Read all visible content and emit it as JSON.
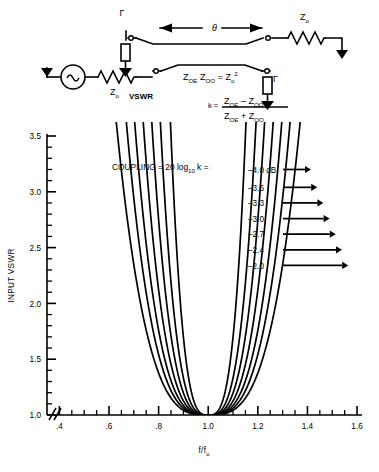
{
  "figure": {
    "title_text": "",
    "schematic": {
      "name": "directional-coupler-schematic",
      "labels": {
        "gamma_top_left": "Γ",
        "gamma_bottom_right": "Γ",
        "theta": "θ",
        "z0_top_right": "Z",
        "z0_top_right_sub": "o",
        "z0_source": "Z",
        "z0_source_sub": "o",
        "vswr": "VSWR",
        "impedance_relation_a": "Z",
        "impedance_relation_a_sub": "OE",
        "impedance_relation_b": "Z",
        "impedance_relation_b_sub": "OO",
        "impedance_relation_eq": "=",
        "impedance_relation_c": "Z",
        "impedance_relation_c_sub": "o",
        "impedance_relation_c_sup": "2",
        "k_eq": "k =",
        "k_num_a": "Z",
        "k_num_a_sub": "OE",
        "k_num_minus": "–",
        "k_num_b": "Z",
        "k_num_b_sub": "OO",
        "k_den_a": "Z",
        "k_den_a_sub": "OE",
        "k_den_plus": "+",
        "k_den_b": "Z",
        "k_den_b_sub": "OO"
      }
    },
    "annotations": {
      "coupling_formula": "COUPLING = 20 log",
      "coupling_formula_sub": "10",
      "coupling_formula_tail": "k ="
    }
  },
  "chart_data": {
    "type": "line",
    "title": "",
    "xlabel": "f/f",
    "xlabel_sub": "o",
    "ylabel": "INPUT VSWR",
    "xlim": [
      0.35,
      1.62
    ],
    "ylim": [
      1.0,
      3.5
    ],
    "xticks": [
      0.4,
      0.6,
      0.8,
      1.0,
      1.2,
      1.4,
      1.6
    ],
    "xtick_labels": [
      ".4",
      ".6",
      ".8",
      "1.0",
      "1.2",
      "1.4",
      "1.6"
    ],
    "x_minor_step": 0.05,
    "yticks": [
      1.0,
      1.5,
      2.0,
      2.5,
      3.0,
      3.5
    ],
    "ytick_labels": [
      "1.0",
      "1.5",
      "2.0",
      "2.5",
      "3.0",
      "3.5"
    ],
    "y_minor_step": 0.1,
    "grid": false,
    "axis_break": true,
    "axis_break_symbol": "//",
    "legend_position": "right-inside",
    "legend_title": "COUPLING = 20 log10 k =",
    "legend_units": "dB",
    "series": [
      {
        "name": "-4.0 dB",
        "label": "–4.0 dB",
        "k": 0.631,
        "vswr_max": 3.52,
        "arrow_y": 3.2
      },
      {
        "name": "-3.6",
        "label": "–3.6",
        "k": 0.661,
        "vswr_max": 3.36,
        "arrow_y": 3.04
      },
      {
        "name": "-3.3",
        "label": "–3.3",
        "k": 0.683,
        "vswr_max": 3.22,
        "arrow_y": 2.9
      },
      {
        "name": "-3.0",
        "label": "–3.0",
        "k": 0.708,
        "vswr_max": 3.06,
        "arrow_y": 2.76
      },
      {
        "name": "-2.7",
        "label": "–2.7",
        "k": 0.733,
        "vswr_max": 2.9,
        "arrow_y": 2.62
      },
      {
        "name": "-2.4",
        "label": "–2.4",
        "k": 0.759,
        "vswr_max": 2.74,
        "arrow_y": 2.48
      },
      {
        "name": "-2.0",
        "label": "–2.0",
        "k": 0.794,
        "vswr_max": 2.52,
        "arrow_y": 2.34
      }
    ],
    "curve_shape": "U-shaped, symmetric about f/f0 = 1.0, minimum VSWR = 1.0 at f/f0 = 1.0",
    "ripple_minima_vswr": 1.0,
    "center_frequency_ratio": 1.0
  }
}
